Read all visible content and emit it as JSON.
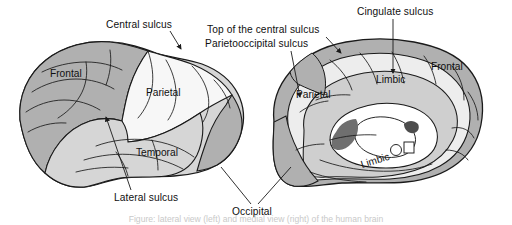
{
  "figure": {
    "caption_fragment": "Figure: lateral view (left) and medial view (right) of the human brain",
    "background_color": "#ffffff",
    "line_color": "#1a1a1a"
  },
  "palette": {
    "frontal_fill": "#b0b0b0",
    "parietal_fill": "#f7f7f7",
    "temporal_fill": "#d6d6d6",
    "occipital_fill": "#b0b0b0",
    "limbic_fill": "#cfcfcf",
    "medial_light_fill": "#ededed",
    "corpus_fill": "#ffffff",
    "deep_fill": "#8e8e8e",
    "outline": "#1a1a1a"
  },
  "views": {
    "lateral": {
      "name": "Lateral view",
      "lobes": [
        {
          "id": "frontal",
          "label": "Frontal",
          "x": 77,
          "y": 73,
          "shade": "dark-gray"
        },
        {
          "id": "parietal",
          "label": "Parietal",
          "x": 170,
          "y": 92,
          "shade": "white"
        },
        {
          "id": "temporal",
          "label": "Temporal",
          "x": 162,
          "y": 152,
          "shade": "light-gray"
        }
      ]
    },
    "medial": {
      "name": "Medial view",
      "lobes": [
        {
          "id": "frontal-medial",
          "label": "Frontal",
          "x": 450,
          "y": 66,
          "shade": "dark-gray"
        },
        {
          "id": "parietal-medial",
          "label": "Parietal",
          "x": 316,
          "y": 94,
          "shade": "white"
        },
        {
          "id": "limbic-upper",
          "label": "Limbic",
          "x": 392,
          "y": 79,
          "shade": "mid-gray"
        },
        {
          "id": "limbic-lower",
          "label": "Limbic",
          "x": 385,
          "y": 160,
          "shade": "mid-gray",
          "rotated": true
        }
      ]
    }
  },
  "callouts": [
    {
      "id": "central-sulcus",
      "label": "Central sulcus",
      "text_x": 106,
      "text_y": 27,
      "leader": "M170,31 L181,48",
      "arrow": "down"
    },
    {
      "id": "top-of-central-sulcus",
      "label": "Top of the central sulcus",
      "text_x": 207,
      "text_y": 32,
      "leader": "M324,35 L340,51",
      "arrow": "down-right"
    },
    {
      "id": "parietooccipital-sulcus",
      "label": "Parietooccipital sulcus",
      "text_x": 205,
      "text_y": 46,
      "leader": "M293,50 L300,96",
      "arrow": "down"
    },
    {
      "id": "cingulate-sulcus",
      "label": "Cingulate sulcus",
      "text_x": 357,
      "text_y": 14,
      "leader": "M393,18 L393,72",
      "arrow": "down"
    },
    {
      "id": "lateral-sulcus",
      "label": "Lateral sulcus",
      "text_x": 115,
      "text_y": 199,
      "leader": "M131,191 L105,116",
      "arrow": "up"
    },
    {
      "id": "occipital",
      "label": "Occipital",
      "text_x": 235,
      "text_y": 213,
      "leader_left": "M252,203 L222,166",
      "leader_right": "M258,203 L290,166",
      "arrow": "none"
    }
  ],
  "labels_all": [
    "Central sulcus",
    "Top of the central sulcus",
    "Parietooccipital sulcus",
    "Cingulate sulcus",
    "Frontal",
    "Parietal",
    "Temporal",
    "Lateral sulcus",
    "Occipital",
    "Limbic"
  ]
}
